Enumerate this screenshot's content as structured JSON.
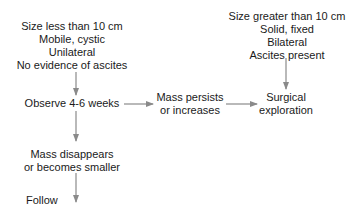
{
  "diagram": {
    "type": "flowchart",
    "nodes": {
      "benign_criteria": {
        "lines": [
          "Size less than 10 cm",
          "Mobile, cystic",
          "Unilateral",
          "No evidence of ascites"
        ]
      },
      "malignant_criteria": {
        "lines": [
          "Size greater than 10 cm",
          "Solid, fixed",
          "Bilateral",
          "Ascites present"
        ]
      },
      "observe": {
        "lines": [
          "Observe 4-6 weeks"
        ]
      },
      "mass_persists": {
        "lines": [
          "Mass persists",
          "or increases"
        ]
      },
      "surgical": {
        "lines": [
          "Surgical",
          "exploration"
        ]
      },
      "mass_disappears": {
        "lines": [
          "Mass disappears",
          "or becomes smaller"
        ]
      },
      "follow": {
        "lines": [
          "Follow"
        ]
      }
    },
    "edges": [
      {
        "from": "benign_criteria",
        "to": "observe"
      },
      {
        "from": "observe",
        "to": "mass_persists"
      },
      {
        "from": "mass_persists",
        "to": "surgical"
      },
      {
        "from": "malignant_criteria",
        "to": "surgical"
      },
      {
        "from": "observe",
        "to": "mass_disappears"
      },
      {
        "from": "mass_disappears",
        "to": "follow"
      }
    ],
    "colors": {
      "text": "#1a1a1a",
      "arrow": "#8a8a8a",
      "background": "#ffffff"
    }
  }
}
